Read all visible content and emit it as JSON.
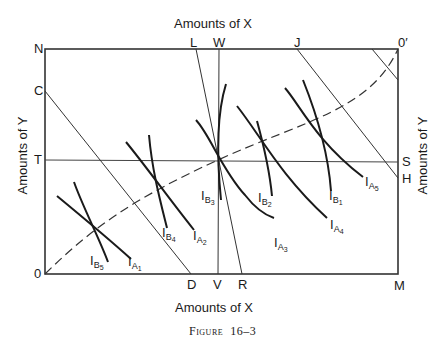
{
  "figure": {
    "caption_prefix": "Figure",
    "caption_number": "16–3",
    "top_axis_title": "Amounts of X",
    "bottom_axis_title": "Amounts of X",
    "left_axis_title": "Amounts of Y",
    "right_axis_title": "Amounts of Y"
  },
  "points": {
    "N": "N",
    "C": "C",
    "T": "T",
    "O": "0",
    "L": "L",
    "W": "W",
    "J": "J",
    "O_prime": "0′",
    "S": "S",
    "H": "H",
    "D": "D",
    "V": "V",
    "R": "R",
    "M": "M"
  },
  "curves": {
    "IA": [
      {
        "main": "I",
        "sub": "A",
        "subsub": "1"
      },
      {
        "main": "I",
        "sub": "A",
        "subsub": "2"
      },
      {
        "main": "I",
        "sub": "A",
        "subsub": "3"
      },
      {
        "main": "I",
        "sub": "A",
        "subsub": "4"
      },
      {
        "main": "I",
        "sub": "A",
        "subsub": "5"
      }
    ],
    "IB": [
      {
        "main": "I",
        "sub": "B",
        "subsub": "1"
      },
      {
        "main": "I",
        "sub": "B",
        "subsub": "2"
      },
      {
        "main": "I",
        "sub": "B",
        "subsub": "3"
      },
      {
        "main": "I",
        "sub": "B",
        "subsub": "4"
      },
      {
        "main": "I",
        "sub": "B",
        "subsub": "5"
      }
    ]
  },
  "colors": {
    "ink": "#1a1a1a",
    "background": "#ffffff"
  }
}
